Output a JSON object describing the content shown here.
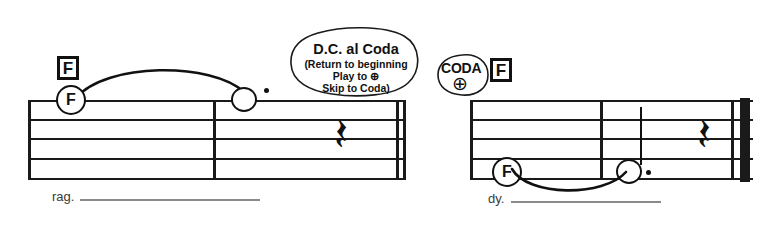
{
  "document": {
    "type": "music-notation-excerpt",
    "title": "D.C. al Coda example"
  },
  "systems": [
    {
      "id": "left-system",
      "chord_symbol": "F",
      "circled_note": "F",
      "lyric": "rag.",
      "notes": [
        {
          "name": "F",
          "kind": "circled-note-name"
        },
        {
          "name": "",
          "kind": "dotted-half-note"
        }
      ],
      "rest": "quarter-rest",
      "rest_glyph": "𝄽",
      "barline_end": "double-thin"
    },
    {
      "id": "right-system",
      "chord_symbol": "F",
      "circled_note": "F",
      "lyric": "dy.",
      "notes": [
        {
          "name": "F",
          "kind": "circled-note-name"
        },
        {
          "name": "",
          "kind": "dotted-half-note"
        }
      ],
      "rest": "quarter-rest",
      "rest_glyph": "𝄽",
      "barline_end": "final"
    }
  ],
  "bubble": {
    "title": "D.C. al Coda",
    "lines": [
      "(Return to beginning",
      "Play to ⊕",
      "Skip to Coda)"
    ]
  },
  "coda_marker": {
    "label": "CODA",
    "sign": "⊕",
    "chord_symbol": "F"
  },
  "colors": {
    "ink": "#111111",
    "lyric": "#3a3a3a",
    "extender": "#8a8a8a",
    "paper": "#ffffff"
  }
}
